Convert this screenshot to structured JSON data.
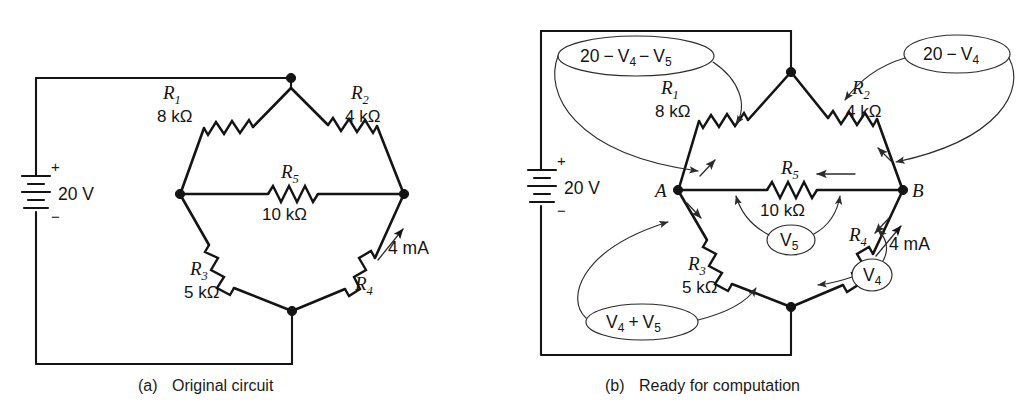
{
  "figure": {
    "kind": "circuit-diagram-pair",
    "panels": [
      {
        "id": "a",
        "caption_tag": "(a)",
        "caption_text": "Original circuit",
        "source": {
          "label": "20 V",
          "plus": "+",
          "minus": "−"
        },
        "components": [
          {
            "name": "R1",
            "symbol": "R",
            "subscript": "1",
            "value": "8 kΩ"
          },
          {
            "name": "R2",
            "symbol": "R",
            "subscript": "2",
            "value": "4 kΩ"
          },
          {
            "name": "R3",
            "symbol": "R",
            "subscript": "3",
            "value": "5 kΩ"
          },
          {
            "name": "R4",
            "symbol": "R",
            "subscript": "4",
            "value": ""
          },
          {
            "name": "R5",
            "symbol": "R",
            "subscript": "5",
            "value": "10 kΩ"
          }
        ],
        "current_label": "4 mA"
      },
      {
        "id": "b",
        "caption_tag": "(b)",
        "caption_text": "Ready for computation",
        "source": {
          "label": "20 V",
          "plus": "+",
          "minus": "−"
        },
        "components": [
          {
            "name": "R1",
            "symbol": "R",
            "subscript": "1",
            "value": "8 kΩ"
          },
          {
            "name": "R2",
            "symbol": "R",
            "subscript": "2",
            "value": "4 kΩ"
          },
          {
            "name": "R3",
            "symbol": "R",
            "subscript": "3",
            "value": "5 kΩ"
          },
          {
            "name": "R4",
            "symbol": "R",
            "subscript": "4",
            "value": ""
          },
          {
            "name": "R5",
            "symbol": "R",
            "subscript": "5",
            "value": "10 kΩ"
          }
        ],
        "node_labels": [
          {
            "name": "node-a",
            "text": "A"
          },
          {
            "name": "node-b",
            "text": "B"
          }
        ],
        "current_label": "4 mA",
        "annotations": [
          {
            "name": "annotation-20-minus-v4-minus-v5",
            "shape": "ellipse",
            "expr": "20 − V4 − V5",
            "parts": [
              "20",
              "−",
              "V",
              "4",
              "−",
              "V",
              "5"
            ],
            "points_to": "R1"
          },
          {
            "name": "annotation-20-minus-v4",
            "shape": "ellipse",
            "expr": "20 − V4",
            "parts": [
              "20",
              "−",
              "V",
              "4"
            ],
            "points_to": "R2"
          },
          {
            "name": "annotation-v4-plus-v5",
            "shape": "ellipse",
            "expr": "V4 + V5",
            "parts": [
              "V",
              "4",
              "+",
              "V",
              "5"
            ],
            "points_to": "R3"
          },
          {
            "name": "annotation-v5",
            "shape": "ellipse",
            "expr": "V5",
            "parts": [
              "V",
              "5"
            ],
            "points_to": "R5"
          },
          {
            "name": "annotation-v4",
            "shape": "ellipse",
            "expr": "V4",
            "parts": [
              "V",
              "4"
            ],
            "points_to": "R4"
          }
        ]
      }
    ],
    "colors": {
      "ink": "#141414",
      "annotation_ink": "#2b2b2b",
      "background": "#ffffff"
    }
  },
  "text": {
    "v20": "20",
    "minus": "−",
    "plus": "+",
    "V": "V",
    "s4": "4",
    "s5": "5",
    "volt20": "20 V",
    "ma4": "4 mA",
    "r": "R",
    "s1": "1",
    "s2": "2",
    "s3": "3",
    "ohm8": "8 kΩ",
    "ohm4": "4 kΩ",
    "ohm5": "5 kΩ",
    "ohm10": "10 kΩ",
    "nodeA": "A",
    "nodeB": "B",
    "capA_tag": "(a)",
    "capA_text": "Original circuit",
    "capB_tag": "(b)",
    "capB_text": "Ready for computation",
    "sgn_plus": "+",
    "sgn_minus": "−"
  }
}
